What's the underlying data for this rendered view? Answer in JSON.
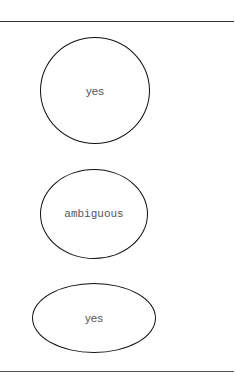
{
  "diagram": {
    "type": "flow-nodes",
    "nodes": [
      {
        "label": "yes",
        "shape": "circle"
      },
      {
        "label": "ambiguous",
        "shape": "ellipse"
      },
      {
        "label": "yes",
        "shape": "ellipse"
      }
    ],
    "colors": {
      "stroke": "#111111",
      "text": "#555555",
      "rule": "#333333",
      "background": "#ffffff"
    }
  }
}
